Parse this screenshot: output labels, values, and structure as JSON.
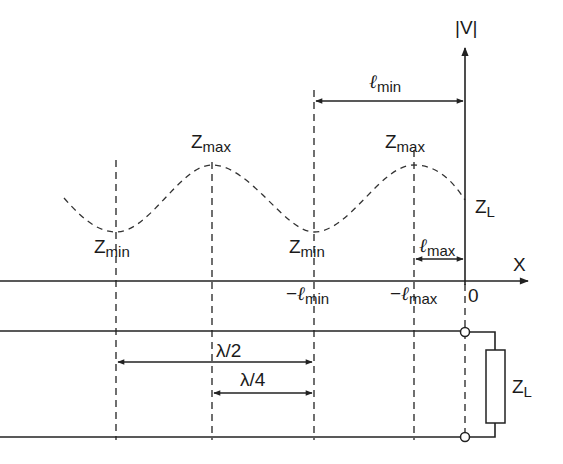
{
  "diagram": {
    "axes": {
      "vertical_label": "|V|",
      "horizontal_label": "X",
      "origin_label": "0"
    },
    "wave_labels": {
      "zmin_1": {
        "main": "Z",
        "sub": "min"
      },
      "zmax_1": {
        "main": "Z",
        "sub": "max"
      },
      "zmin_2": {
        "main": "Z",
        "sub": "min"
      },
      "zmax_2": {
        "main": "Z",
        "sub": "max"
      },
      "zl_top": {
        "main": "Z",
        "sub": "L"
      }
    },
    "axis_ticks": {
      "neg_lmin": {
        "prefix": "−",
        "main": "ℓ",
        "sub": "min"
      },
      "neg_lmax": {
        "prefix": "−",
        "main": "ℓ",
        "sub": "max"
      }
    },
    "dimensions": {
      "lmin": {
        "main": "ℓ",
        "sub": "min"
      },
      "lmax": {
        "main": "ℓ",
        "sub": "max"
      },
      "half_wave": "λ/2",
      "quarter_wave": "λ/4"
    },
    "load": {
      "main": "Z",
      "sub": "L"
    }
  }
}
